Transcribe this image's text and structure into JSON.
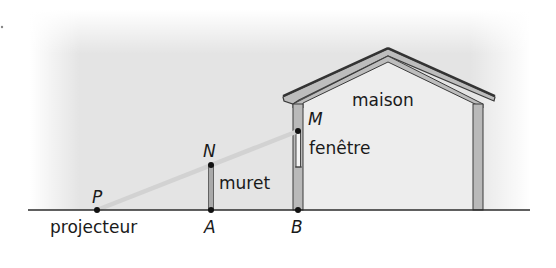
{
  "diagram": {
    "type": "geometry-scene",
    "colors": {
      "background_shade": "#e6e6e6",
      "wall_fill": "#b9b9b9",
      "house_interior": "#ebebeb",
      "outline": "#3a3a3a",
      "light_beam": "#d4d4d4",
      "ground": "#2b2b2b",
      "point": "#111111"
    },
    "points": {
      "P": {
        "label": "P",
        "x": 97,
        "y": 210
      },
      "A": {
        "label": "A",
        "x": 211,
        "y": 210
      },
      "B": {
        "label": "B",
        "x": 298,
        "y": 210
      },
      "N": {
        "label": "N",
        "x": 211,
        "y": 165
      },
      "M": {
        "label": "M",
        "x": 298,
        "y": 131
      }
    },
    "labels": {
      "projecteur": "projecteur",
      "muret": "muret",
      "maison": "maison",
      "fenetre": "fenêtre"
    },
    "segments": [
      {
        "from": "P",
        "to": "M",
        "style": "light-beam"
      },
      {
        "from": "A",
        "to": "N",
        "style": "wall"
      },
      {
        "from": "P",
        "to": "B",
        "style": "ground"
      }
    ]
  }
}
